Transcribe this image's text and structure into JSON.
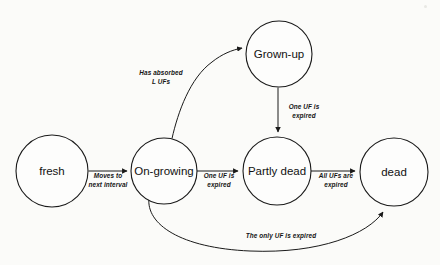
{
  "diagram": {
    "type": "state-transition-diagram",
    "background_color": "#fbfbf9",
    "stroke_color": "#1a1a1a",
    "nodes": [
      {
        "id": "fresh",
        "label": "fresh",
        "cx": 52,
        "cy": 171,
        "r": 36
      },
      {
        "id": "on-growing",
        "label": "On-growing",
        "cx": 164,
        "cy": 171,
        "r": 33
      },
      {
        "id": "grown-up",
        "label": "Grown-up",
        "cx": 279,
        "cy": 54,
        "r": 33
      },
      {
        "id": "partly-dead",
        "label": "Partly dead",
        "cx": 277,
        "cy": 171,
        "r": 34
      },
      {
        "id": "dead",
        "label": "dead",
        "cx": 394,
        "cy": 172,
        "r": 34
      }
    ],
    "edges": [
      {
        "id": "fresh-to-on-growing",
        "from": "fresh",
        "to": "on-growing",
        "label_line1": "Moves to",
        "label_line2": "next interval",
        "label_x": 108,
        "label_y": 178
      },
      {
        "id": "on-growing-to-grown-up",
        "from": "on-growing",
        "to": "grown-up",
        "label_line1": "Has absorbed",
        "label_line2": "L UFs",
        "label_x": 161,
        "label_y": 75
      },
      {
        "id": "grown-up-to-partly-dead",
        "from": "grown-up",
        "to": "partly-dead",
        "label_line1": "One UF is",
        "label_line2": "expired",
        "label_x": 303,
        "label_y": 110
      },
      {
        "id": "on-growing-to-partly-dead",
        "from": "on-growing",
        "to": "partly-dead",
        "label_line1": "One UF is",
        "label_line2": "expired",
        "label_x": 219,
        "label_y": 178
      },
      {
        "id": "partly-dead-to-dead",
        "from": "partly-dead",
        "to": "dead",
        "label_line1": "All UFs are",
        "label_line2": "expired",
        "label_x": 336,
        "label_y": 178
      },
      {
        "id": "on-growing-to-dead",
        "from": "on-growing",
        "to": "dead",
        "label_line1": "The only UF is expired",
        "label_line2": "",
        "label_x": 281,
        "label_y": 235
      }
    ]
  }
}
